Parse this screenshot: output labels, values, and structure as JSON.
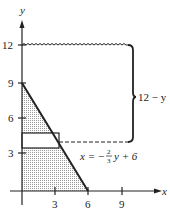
{
  "axes": {
    "x_label": "x",
    "y_label": "y",
    "x_ticks": [
      "3",
      "6",
      "9"
    ],
    "y_ticks": [
      "3",
      "6",
      "9",
      "12"
    ]
  },
  "annotations": {
    "brace_label": "12 − y",
    "line_eq_x": "x = −",
    "line_eq_num": "2",
    "line_eq_den": "3",
    "line_eq_rest": "y + 6"
  },
  "colors": {
    "ink": "#222222",
    "shade": "#d8d8d8"
  }
}
